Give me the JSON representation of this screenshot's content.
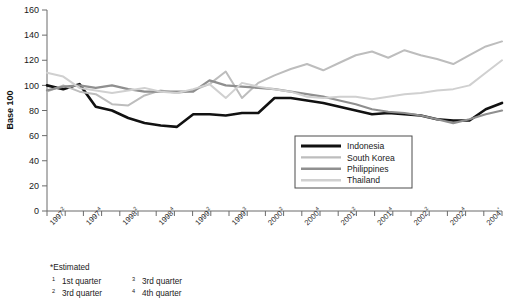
{
  "chart_data": {
    "type": "line",
    "title": "",
    "xlabel": "",
    "ylabel": "Base 100",
    "ylim": [
      0,
      160
    ],
    "yticks": [
      0,
      20,
      40,
      60,
      80,
      100,
      120,
      140,
      160
    ],
    "grid": false,
    "legend_position": "inside-lower-right",
    "x_tick_labels": [
      {
        "base": "1997",
        "sup": "2"
      },
      {
        "base": "",
        "sup": ""
      },
      {
        "base": "1997",
        "sup": "4"
      },
      {
        "base": "",
        "sup": ""
      },
      {
        "base": "1998",
        "sup": "2"
      },
      {
        "base": "",
        "sup": ""
      },
      {
        "base": "1998",
        "sup": "4"
      },
      {
        "base": "",
        "sup": ""
      },
      {
        "base": "1999",
        "sup": "2"
      },
      {
        "base": "",
        "sup": ""
      },
      {
        "base": "1999",
        "sup": "3"
      },
      {
        "base": "",
        "sup": ""
      },
      {
        "base": "2000",
        "sup": "2"
      },
      {
        "base": "",
        "sup": ""
      },
      {
        "base": "2000",
        "sup": "4"
      },
      {
        "base": "",
        "sup": ""
      },
      {
        "base": "2001",
        "sup": "2"
      },
      {
        "base": "",
        "sup": ""
      },
      {
        "base": "2001",
        "sup": "4"
      },
      {
        "base": "",
        "sup": ""
      },
      {
        "base": "2002",
        "sup": "2"
      },
      {
        "base": "",
        "sup": ""
      },
      {
        "base": "2002",
        "sup": "4"
      },
      {
        "base": "",
        "sup": ""
      },
      {
        "base": "2004",
        "sup": "*"
      },
      {
        "base": "",
        "sup": ""
      }
    ],
    "x_index": [
      0,
      1,
      2,
      3,
      4,
      5,
      6,
      7,
      8,
      9,
      10,
      11,
      12,
      13,
      14,
      15,
      16,
      17,
      18,
      19,
      20,
      21,
      22,
      23,
      24,
      25
    ],
    "series": [
      {
        "name": "Indonesia",
        "color": "#111111",
        "width": 2.6,
        "values": [
          100,
          97,
          101,
          83,
          80,
          74,
          70,
          68,
          67,
          77,
          77,
          76,
          78,
          78,
          90,
          90,
          88,
          86,
          83,
          80,
          77,
          78,
          77,
          76,
          73,
          72,
          72,
          81,
          86
        ]
      },
      {
        "name": "South Korea",
        "color": "#bdbdbd",
        "width": 2.0,
        "values": [
          95,
          100,
          95,
          93,
          85,
          84,
          92,
          96,
          94,
          96,
          101,
          111,
          90,
          102,
          108,
          113,
          117,
          112,
          118,
          124,
          127,
          122,
          128,
          124,
          121,
          117,
          124,
          131,
          135
        ]
      },
      {
        "name": "Philippines",
        "color": "#8f8f8f",
        "width": 2.2,
        "values": [
          96,
          99,
          100,
          98,
          100,
          97,
          95,
          95,
          95,
          95,
          104,
          100,
          99,
          98,
          97,
          95,
          93,
          91,
          88,
          85,
          81,
          79,
          78,
          76,
          73,
          70,
          73,
          77,
          80
        ]
      },
      {
        "name": "Thailand",
        "color": "#d0d0d0",
        "width": 2.0,
        "values": [
          110,
          107,
          98,
          96,
          94,
          96,
          98,
          95,
          94,
          97,
          101,
          90,
          102,
          99,
          97,
          95,
          91,
          90,
          91,
          91,
          89,
          91,
          93,
          94,
          96,
          97,
          100,
          110,
          120
        ]
      }
    ]
  },
  "legend": {
    "items": [
      {
        "label": "Indonesia"
      },
      {
        "label": "South Korea"
      },
      {
        "label": "Philippines"
      },
      {
        "label": "Thailand"
      }
    ]
  },
  "footnotes": {
    "estimated": "*Estimated",
    "rows": [
      {
        "sup_left": "1",
        "text_left": "1st quarter",
        "sup_right": "3",
        "text_right": "3rd quarter"
      },
      {
        "sup_left": "2",
        "text_left": "3rd quarter",
        "sup_right": "4",
        "text_right": "4th quarter"
      }
    ]
  }
}
